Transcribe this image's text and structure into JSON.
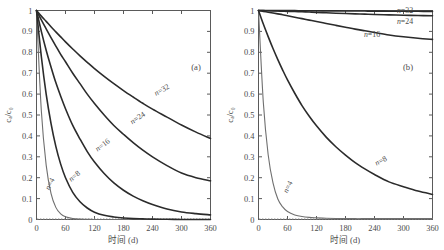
{
  "figure": {
    "width": 444,
    "height": 250,
    "background": "#ffffff",
    "panels": [
      "a",
      "b"
    ]
  },
  "panel_a": {
    "tag": "(a)",
    "xlabel": "时间 (d)",
    "ylabel": "cₐ/c₀"
  },
  "panel_b": {
    "tag": "(b)",
    "xlabel": "时间 (d)",
    "ylabel": "cₐ/c₀"
  },
  "axis": {
    "x_ticks": [
      0,
      60,
      120,
      180,
      240,
      300,
      360
    ],
    "x_tick_labels": [
      "0",
      "60",
      "120",
      "180",
      "240",
      "300",
      "360"
    ],
    "y_ticks": [
      0,
      0.1,
      0.2,
      0.3,
      0.4,
      0.5,
      0.6,
      0.7,
      0.8,
      0.9,
      1
    ],
    "y_tick_labels": [
      "0",
      "0.1",
      "0.2",
      "0.3",
      "0.4",
      "0.5",
      "0.6",
      "0.7",
      "0.8",
      "0.9",
      "1"
    ],
    "xlim": [
      0,
      360
    ],
    "ylim": [
      0,
      1
    ],
    "grid": false,
    "frame_color": "#5a5a5a"
  },
  "series_labels": {
    "n4": "n=4",
    "n8": "n=8",
    "n16": "n=16",
    "n24": "n=24",
    "n32": "n=32"
  },
  "chart_data": [
    {
      "type": "line",
      "title": "(a)",
      "xlabel": "时间 (d)",
      "ylabel": "cₐ/c₀",
      "xlim": [
        0,
        360
      ],
      "ylim": [
        0,
        1
      ],
      "grid": false,
      "legend_position": "inline-curve-labels",
      "x": [
        0,
        10,
        20,
        30,
        40,
        50,
        60,
        75,
        90,
        105,
        120,
        140,
        160,
        180,
        200,
        220,
        240,
        270,
        300,
        330,
        360
      ],
      "series": [
        {
          "name": "n=4",
          "label": "n=4",
          "style": "thin",
          "values": [
            1.0,
            0.52,
            0.26,
            0.125,
            0.058,
            0.027,
            0.013,
            0.005,
            0.002,
            0.001,
            0.0,
            0.0,
            0.0,
            0.0,
            0.0,
            0.0,
            0.0,
            0.0,
            0.0,
            0.0,
            0.0
          ]
        },
        {
          "name": "n=8",
          "label": "n=8",
          "style": "thick",
          "values": [
            1.0,
            0.78,
            0.6,
            0.46,
            0.35,
            0.265,
            0.2,
            0.13,
            0.085,
            0.055,
            0.035,
            0.02,
            0.012,
            0.007,
            0.004,
            0.003,
            0.002,
            0.001,
            0.0,
            0.0,
            0.0
          ]
        },
        {
          "name": "n=16",
          "label": "n=16",
          "style": "thick",
          "values": [
            1.0,
            0.9,
            0.81,
            0.73,
            0.655,
            0.59,
            0.53,
            0.45,
            0.385,
            0.325,
            0.275,
            0.22,
            0.175,
            0.14,
            0.112,
            0.09,
            0.072,
            0.05,
            0.036,
            0.028,
            0.022
          ]
        },
        {
          "name": "n=24",
          "label": "n=24",
          "style": "thick",
          "values": [
            1.0,
            0.955,
            0.912,
            0.87,
            0.83,
            0.79,
            0.755,
            0.7,
            0.65,
            0.6,
            0.555,
            0.5,
            0.45,
            0.408,
            0.368,
            0.332,
            0.3,
            0.258,
            0.222,
            0.2,
            0.185
          ]
        },
        {
          "name": "n=32",
          "label": "n=32",
          "style": "thick",
          "values": [
            1.0,
            0.973,
            0.948,
            0.922,
            0.898,
            0.874,
            0.85,
            0.816,
            0.783,
            0.752,
            0.722,
            0.685,
            0.65,
            0.617,
            0.586,
            0.556,
            0.528,
            0.49,
            0.452,
            0.418,
            0.388
          ]
        }
      ]
    },
    {
      "type": "line",
      "title": "(b)",
      "xlabel": "时间 (d)",
      "ylabel": "cₐ/c₀",
      "xlim": [
        0,
        360
      ],
      "ylim": [
        0,
        1
      ],
      "grid": false,
      "legend_position": "inline-curve-labels",
      "x": [
        0,
        10,
        20,
        30,
        40,
        50,
        60,
        75,
        90,
        105,
        120,
        140,
        160,
        180,
        200,
        220,
        240,
        270,
        300,
        330,
        360
      ],
      "series": [
        {
          "name": "n=4",
          "label": "n=4",
          "style": "thin",
          "values": [
            1.0,
            0.56,
            0.31,
            0.175,
            0.098,
            0.06,
            0.038,
            0.022,
            0.014,
            0.01,
            0.008,
            0.006,
            0.005,
            0.005,
            0.004,
            0.004,
            0.004,
            0.004,
            0.004,
            0.004,
            0.004
          ]
        },
        {
          "name": "n=8",
          "label": "n=8",
          "style": "thick",
          "values": [
            1.0,
            0.935,
            0.875,
            0.818,
            0.765,
            0.715,
            0.668,
            0.604,
            0.545,
            0.494,
            0.448,
            0.394,
            0.348,
            0.308,
            0.272,
            0.242,
            0.215,
            0.18,
            0.157,
            0.136,
            0.12
          ]
        },
        {
          "name": "n=16",
          "label": "n=16",
          "style": "thick",
          "values": [
            1.0,
            0.996,
            0.992,
            0.988,
            0.984,
            0.98,
            0.975,
            0.968,
            0.961,
            0.954,
            0.947,
            0.938,
            0.929,
            0.92,
            0.911,
            0.903,
            0.895,
            0.883,
            0.874,
            0.867,
            0.862
          ]
        },
        {
          "name": "n=24",
          "label": "n=24",
          "style": "thick",
          "values": [
            1.0,
            0.9994,
            0.9988,
            0.9982,
            0.9975,
            0.9968,
            0.996,
            0.995,
            0.9938,
            0.9925,
            0.991,
            0.989,
            0.9872,
            0.9855,
            0.984,
            0.9825,
            0.981,
            0.979,
            0.9775,
            0.976,
            0.975
          ]
        },
        {
          "name": "n=32",
          "label": "n=32",
          "style": "thick",
          "values": [
            1.0,
            0.9999,
            0.9998,
            0.9997,
            0.9996,
            0.9995,
            0.9994,
            0.9992,
            0.999,
            0.9988,
            0.9986,
            0.9983,
            0.998,
            0.9978,
            0.9975,
            0.9973,
            0.997,
            0.9967,
            0.9964,
            0.9961,
            0.9958
          ]
        }
      ]
    }
  ]
}
